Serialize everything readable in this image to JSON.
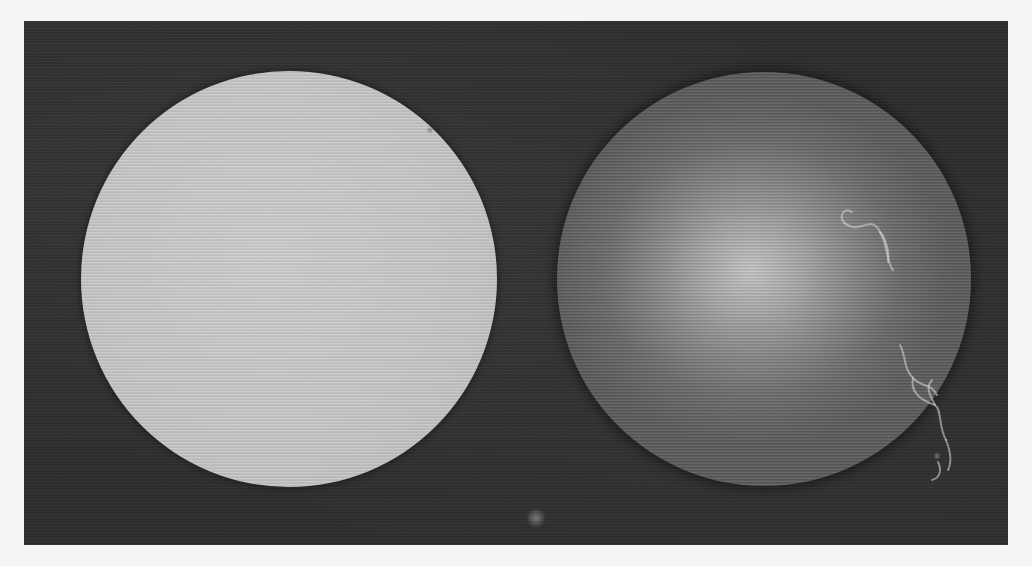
{
  "image": {
    "width": 1032,
    "height": 566,
    "page_background": "#f5f5f5"
  },
  "frame": {
    "left": 24,
    "top": 21,
    "width": 984,
    "height": 524,
    "background": "#2e2e2e"
  },
  "discs": [
    {
      "id": "left",
      "description": "uniform light gray disc",
      "center_x": 289,
      "center_y": 279,
      "radius": 208,
      "fill": "#c9c9c9"
    },
    {
      "id": "right",
      "description": "darker gray disc with bright central glow and white fibrous streaks near right edge",
      "center_x": 764,
      "center_y": 279,
      "radius": 207,
      "fill": "#6c6c6c",
      "highlight": {
        "x": 752,
        "y": 272,
        "color": "#c6c6c6"
      }
    }
  ],
  "streaks": {
    "color": "#e0e0e0",
    "paths": [
      "M852 212 C 842 205, 836 222, 850 226 C 860 232, 872 215, 880 232 C 888 245, 886 262, 893 270",
      "M880 232 C 884 236, 890 250, 888 262",
      "M900 345 C 906 355, 903 368, 913 378 C 922 388, 930 382, 937 395",
      "M913 378 C 910 392, 920 400, 935 405 C 942 410, 938 425, 946 440",
      "M935 405 C 930 395, 925 388, 932 380",
      "M946 440 C 950 450, 952 462, 948 470",
      "M938 462 C 942 470, 940 478, 932 480"
    ]
  },
  "specks": [
    {
      "x": 536,
      "y": 518,
      "r": 5
    },
    {
      "x": 937,
      "y": 456,
      "r": 2
    },
    {
      "x": 430,
      "y": 130,
      "r": 2
    }
  ]
}
